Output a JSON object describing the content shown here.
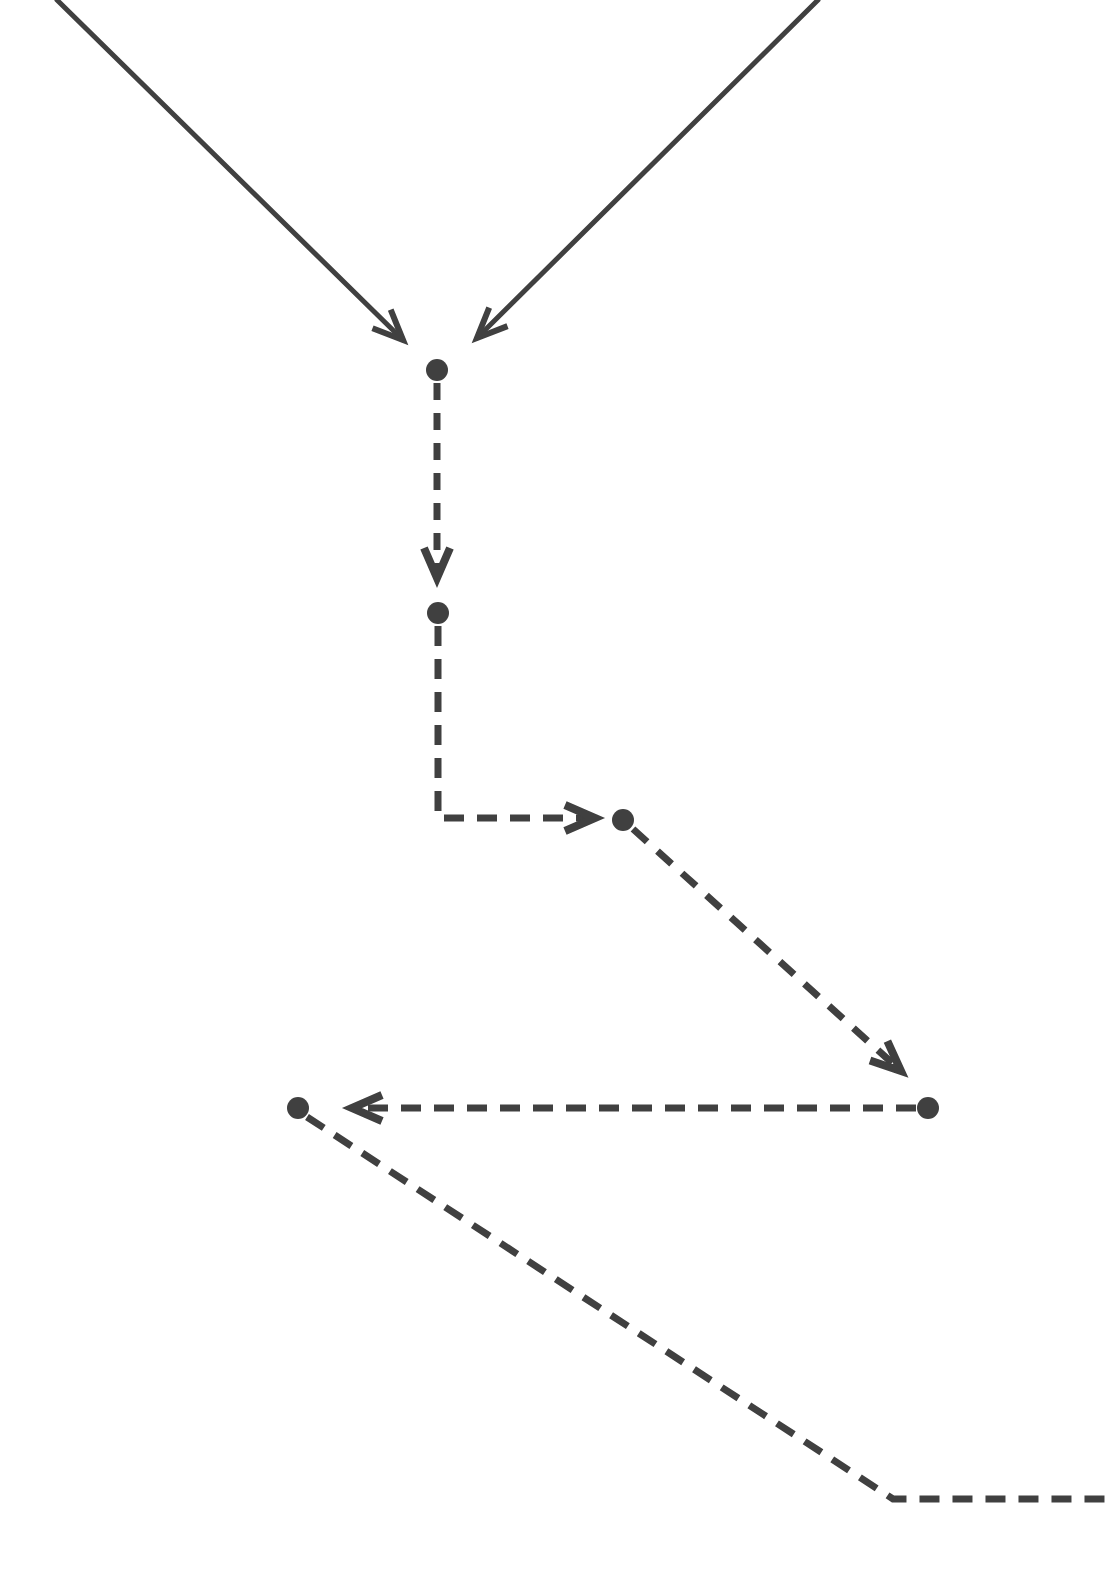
{
  "figure": {
    "kind": "trajectory-flow-diagram",
    "width": 1109,
    "height": 1595,
    "background_color": "#ffffff",
    "stroke_color": "#404040",
    "node_fill_color": "#404040"
  },
  "style": {
    "solid_line_width": 5,
    "dashed_line_width": 7,
    "node_radius": 11,
    "dash_pattern_vertical": "17 13",
    "dash_pattern_horizontal": "20 13",
    "dash_pattern_diagonal": "19 14",
    "arrowhead_length": 30,
    "arrowhead_half_width": 13
  },
  "nodes": [
    {
      "id": "n1",
      "label": "",
      "x": 437,
      "y": 370,
      "r": 11
    },
    {
      "id": "n2",
      "label": "",
      "x": 438,
      "y": 613,
      "r": 11
    },
    {
      "id": "n3",
      "label": "",
      "x": 623,
      "y": 820,
      "r": 11
    },
    {
      "id": "n4",
      "label": "",
      "x": 928,
      "y": 1108,
      "r": 11
    },
    {
      "id": "n5",
      "label": "",
      "x": 298,
      "y": 1108,
      "r": 11
    }
  ],
  "edges": [
    {
      "id": "e1",
      "style": "solid",
      "arrow": "end",
      "from": "top-left-offscreen",
      "to": "n1",
      "points": "57,0 403,340"
    },
    {
      "id": "e2",
      "style": "solid",
      "arrow": "end",
      "from": "top-right-offscreen",
      "to": "n1",
      "points": "818,0 477,338"
    },
    {
      "id": "e3",
      "style": "dashed",
      "arrow": "end",
      "from": "n1",
      "to": "n2",
      "points": "437,383 437,578"
    },
    {
      "id": "e4",
      "style": "dashed",
      "arrow": "end",
      "from": "n2",
      "to": "n3",
      "points": "438,626 438,818 595,818"
    },
    {
      "id": "e5",
      "style": "dashed",
      "arrow": "end",
      "from": "n3",
      "to": "n4",
      "points": "633,829 901,1071"
    },
    {
      "id": "e6",
      "style": "dashed",
      "arrow": "end",
      "from": "n4",
      "to": "n5",
      "points": "916,1108 352,1108"
    },
    {
      "id": "e7",
      "style": "dashed",
      "arrow": "none",
      "from": "n5",
      "to": "bottom-right-offscreen",
      "points": "307,1117 893,1499 1109,1499"
    }
  ]
}
